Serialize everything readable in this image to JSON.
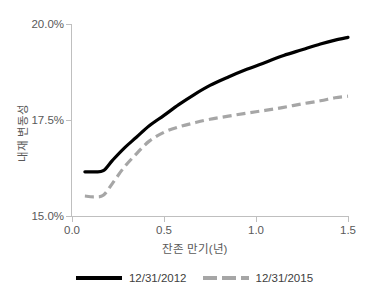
{
  "chart_data": {
    "type": "line",
    "title": "",
    "xlabel": "잔존 만기(년)",
    "ylabel": "내재 변동성",
    "xlim": [
      0.0,
      1.5
    ],
    "ylim": [
      15.0,
      20.0
    ],
    "xticks": [
      "0.0",
      "0.5",
      "1.0",
      "1.5"
    ],
    "xtick_values": [
      0.0,
      0.5,
      1.0,
      1.5
    ],
    "yticks": [
      "15.0%",
      "17.5%",
      "20.0%"
    ],
    "ytick_values": [
      15.0,
      17.5,
      20.0
    ],
    "grid": false,
    "legend_position": "bottom",
    "series": [
      {
        "name": "12/31/2012",
        "color": "#000000",
        "style": "solid",
        "x": [
          0.07,
          0.12,
          0.17,
          0.22,
          0.28,
          0.35,
          0.42,
          0.5,
          0.58,
          0.66,
          0.75,
          0.85,
          0.95,
          1.05,
          1.15,
          1.25,
          1.35,
          1.43,
          1.5
        ],
        "values": [
          16.15,
          16.15,
          16.18,
          16.45,
          16.75,
          17.05,
          17.35,
          17.62,
          17.9,
          18.15,
          18.4,
          18.62,
          18.82,
          19.0,
          19.18,
          19.33,
          19.48,
          19.58,
          19.65
        ]
      },
      {
        "name": "12/31/2015",
        "color": "#a6a6a6",
        "style": "dashed",
        "x": [
          0.07,
          0.12,
          0.17,
          0.22,
          0.28,
          0.35,
          0.42,
          0.5,
          0.58,
          0.66,
          0.75,
          0.85,
          0.95,
          1.05,
          1.15,
          1.25,
          1.35,
          1.43,
          1.5
        ],
        "values": [
          15.52,
          15.5,
          15.54,
          15.85,
          16.25,
          16.62,
          16.95,
          17.18,
          17.32,
          17.42,
          17.52,
          17.6,
          17.68,
          17.75,
          17.83,
          17.92,
          18.0,
          18.08,
          18.12
        ]
      }
    ]
  },
  "axes": {
    "y_title": "내재 변동성",
    "x_title": "잔존 만기(년)"
  },
  "legend": {
    "entries": [
      {
        "label": "12/31/2012",
        "style": "solid"
      },
      {
        "label": "12/31/2015",
        "style": "dashed"
      }
    ]
  },
  "colors": {
    "series_2012": "#000000",
    "series_2015": "#a6a6a6",
    "axis": "#bfbfbf",
    "text": "#595959",
    "background": "#ffffff"
  }
}
